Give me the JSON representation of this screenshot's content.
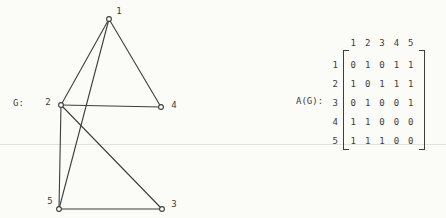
{
  "page": {
    "background": "#fbfbf8",
    "ink": "#3d3d3d",
    "scan_line_color": "#e2e2dd",
    "scan_line_y": 144
  },
  "graph": {
    "label": "G:",
    "vertices": [
      {
        "id": "1",
        "x": 109,
        "y": 19,
        "label_x": 119,
        "label_y": 11
      },
      {
        "id": "2",
        "x": 61,
        "y": 105,
        "label_x": 48,
        "label_y": 102
      },
      {
        "id": "3",
        "x": 162,
        "y": 209,
        "label_x": 174,
        "label_y": 204
      },
      {
        "id": "4",
        "x": 161,
        "y": 107,
        "label_x": 174,
        "label_y": 105
      },
      {
        "id": "5",
        "x": 59,
        "y": 209,
        "label_x": 50,
        "label_y": 201
      }
    ],
    "edges": [
      [
        "1",
        "2"
      ],
      [
        "1",
        "4"
      ],
      [
        "1",
        "5"
      ],
      [
        "2",
        "3"
      ],
      [
        "2",
        "4"
      ],
      [
        "2",
        "5"
      ],
      [
        "3",
        "5"
      ]
    ]
  },
  "matrix": {
    "label": "A(G):",
    "column_headers": [
      "1",
      "2",
      "3",
      "4",
      "5"
    ],
    "row_headers": [
      "1",
      "2",
      "3",
      "4",
      "5"
    ],
    "rows": [
      [
        0,
        1,
        0,
        1,
        1
      ],
      [
        1,
        0,
        1,
        1,
        1
      ],
      [
        0,
        1,
        0,
        0,
        1
      ],
      [
        1,
        1,
        0,
        0,
        0
      ],
      [
        1,
        1,
        1,
        0,
        0
      ]
    ]
  }
}
